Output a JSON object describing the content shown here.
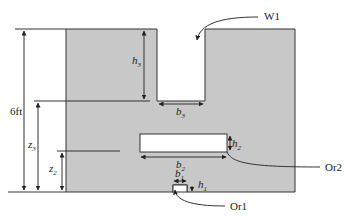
{
  "diagram": {
    "type": "tank cross-section with weir and orifices",
    "colors": {
      "fill": "#c8c8c8",
      "stroke": "#333333",
      "background": "#ffffff"
    },
    "labels": {
      "weir": "W1",
      "orifice_upper": "Or2",
      "orifice_lower": "Or1",
      "total_height": "6ft",
      "h3": "h",
      "h3_sub": "3",
      "b3": "b",
      "b3_sub": "3",
      "z3": "z",
      "z3_sub": "3",
      "z2": "z",
      "z2_sub": "2",
      "h2": "h",
      "h2_sub": "2",
      "b2": "b",
      "b2_sub": "2",
      "b1": "b",
      "b1_sub": "1",
      "h1": "h",
      "h1_sub": "1"
    }
  }
}
